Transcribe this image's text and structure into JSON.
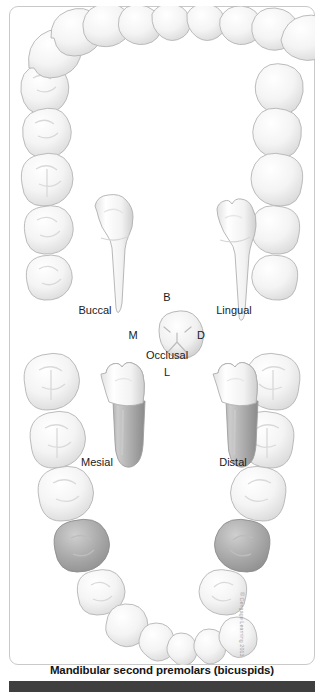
{
  "figure": {
    "caption": "Mandibular second premolars (bicuspids)",
    "copyright": "© Cengage Learning 2013",
    "background_color": "#ffffff",
    "frame_color": "#c9c9c9",
    "caption_bar_color": "#3f3f3f",
    "tooth_fill": "#f3f3f3",
    "tooth_stroke": "#b4b4b4",
    "highlight_fill": "#a8a8a8",
    "root_shade": "#9c9c9c"
  },
  "views": {
    "buccal": {
      "label": "Buccal"
    },
    "lingual": {
      "label": "Lingual"
    },
    "occlusal": {
      "label": "Occlusal"
    },
    "mesial": {
      "label": "Mesial"
    },
    "distal": {
      "label": "Distal"
    }
  },
  "orientation": {
    "buccal_letter": "B",
    "lingual_letter": "L",
    "mesial_letter": "M",
    "distal_letter": "D"
  },
  "arch": {
    "description": "Full dental arch of teeth arranged in an oval",
    "highlighted_count": 2,
    "highlighted_teeth": [
      "mandibular left second premolar",
      "mandibular right second premolar"
    ]
  }
}
